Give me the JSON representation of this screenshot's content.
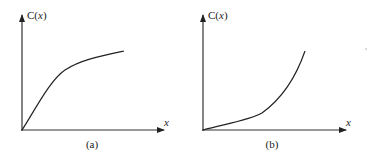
{
  "figure": {
    "panels": [
      {
        "id": "a",
        "caption": "(a)",
        "y_label_prefix": "C(",
        "y_label_var": "x",
        "y_label_suffix": ")",
        "x_label": "x",
        "curve": "concave increasing (saturating)"
      },
      {
        "id": "b",
        "caption": "(b)",
        "y_label_prefix": "C(",
        "y_label_var": "x",
        "y_label_suffix": ")",
        "x_label": "x",
        "curve": "convex increasing (accelerating)"
      }
    ],
    "colors": {
      "axis": "#333333",
      "curve": "#222222",
      "background": "#ffffff"
    }
  }
}
